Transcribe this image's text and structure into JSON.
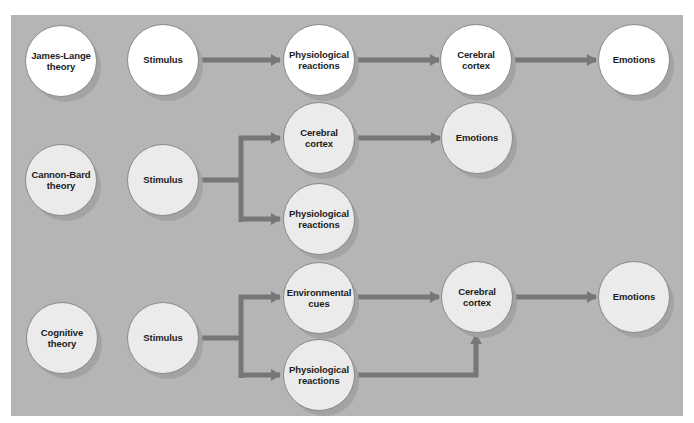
{
  "colors": {
    "panel_background": "#b5b5b5",
    "arrow": "#777777",
    "node_border": "#8a8a8a",
    "row1_node_fill": "#ffffff",
    "row23_node_fill": "#ebebeb",
    "text": "#1c1c1c"
  },
  "rows": {
    "james_lange": {
      "theory": "James-Lange\ntheory",
      "stimulus": "Stimulus",
      "physiological": "Physiological\nreactions",
      "cortex": "Cerebral\ncortex",
      "emotions": "Emotions"
    },
    "cannon_bard": {
      "theory": "Cannon-Bard\ntheory",
      "stimulus": "Stimulus",
      "cortex": "Cerebral\ncortex",
      "emotions": "Emotions",
      "physiological": "Physiological\nreactions"
    },
    "cognitive": {
      "theory": "Cognitive\ntheory",
      "stimulus": "Stimulus",
      "environmental": "Environmental\ncues",
      "physiological": "Physiological\nreactions",
      "cortex": "Cerebral\ncortex",
      "emotions": "Emotions"
    }
  },
  "flows": [
    {
      "theory": "James-Lange theory",
      "edges": [
        [
          "Stimulus",
          "Physiological reactions"
        ],
        [
          "Physiological reactions",
          "Cerebral cortex"
        ],
        [
          "Cerebral cortex",
          "Emotions"
        ]
      ]
    },
    {
      "theory": "Cannon-Bard theory",
      "edges": [
        [
          "Stimulus",
          "Cerebral cortex"
        ],
        [
          "Stimulus",
          "Physiological reactions"
        ],
        [
          "Cerebral cortex",
          "Emotions"
        ]
      ]
    },
    {
      "theory": "Cognitive theory",
      "edges": [
        [
          "Stimulus",
          "Environmental cues"
        ],
        [
          "Stimulus",
          "Physiological reactions"
        ],
        [
          "Environmental cues",
          "Cerebral cortex"
        ],
        [
          "Physiological reactions",
          "Cerebral cortex"
        ],
        [
          "Cerebral cortex",
          "Emotions"
        ]
      ]
    }
  ]
}
